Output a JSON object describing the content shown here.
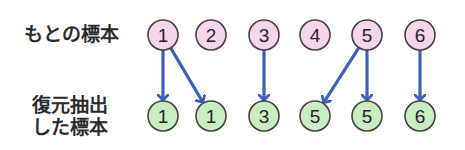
{
  "labels": {
    "original": "もとの標本",
    "resampled_line1": "復元抽出",
    "resampled_line2": "した標本"
  },
  "colors": {
    "original_fill": "#f6d6ea",
    "resampled_fill": "#c9edc3",
    "node_stroke": "#4a3c44",
    "arrow": "#3d5fb7"
  },
  "original_sample": [
    {
      "value": "1",
      "x": 163
    },
    {
      "value": "2",
      "x": 211
    },
    {
      "value": "3",
      "x": 264
    },
    {
      "value": "4",
      "x": 315
    },
    {
      "value": "5",
      "x": 367
    },
    {
      "value": "6",
      "x": 420
    }
  ],
  "resampled_sample": [
    {
      "value": "1",
      "x": 163
    },
    {
      "value": "1",
      "x": 211
    },
    {
      "value": "3",
      "x": 264
    },
    {
      "value": "5",
      "x": 315
    },
    {
      "value": "5",
      "x": 367
    },
    {
      "value": "6",
      "x": 420
    }
  ],
  "arrows": [
    {
      "from": 0,
      "to": 0
    },
    {
      "from": 0,
      "to": 1
    },
    {
      "from": 2,
      "to": 2
    },
    {
      "from": 4,
      "to": 3
    },
    {
      "from": 4,
      "to": 4
    },
    {
      "from": 5,
      "to": 5
    }
  ]
}
